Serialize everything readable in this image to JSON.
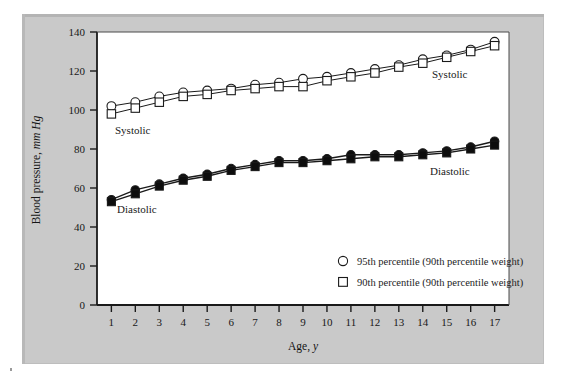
{
  "figure": {
    "panel_background": "#c9c9c9",
    "plot_background": "#ffffff",
    "line_color": "#1a1a1a"
  },
  "axes": {
    "y_title_main": "Blood pressure,",
    "y_title_units": "mm Hg",
    "x_title_main": "Age,",
    "x_title_units": "y",
    "y_ticks": [
      "0",
      "20",
      "40",
      "60",
      "80",
      "100",
      "120",
      "140"
    ],
    "x_ticks": [
      "1",
      "2",
      "3",
      "4",
      "5",
      "6",
      "7",
      "8",
      "9",
      "10",
      "11",
      "12",
      "13",
      "14",
      "15",
      "16",
      "17"
    ]
  },
  "annotations": {
    "systolic_left": "Systolic",
    "systolic_right": "Systolic",
    "diastolic_left": "Diastolic",
    "diastolic_right": "Diastolic"
  },
  "legend": {
    "items": [
      {
        "marker": "circle-open-icon",
        "label": "95th percentile (90th percentile weight)"
      },
      {
        "marker": "square-open-icon",
        "label": "90th percentile (90th percentile weight)"
      }
    ]
  },
  "chart_data": {
    "type": "line",
    "title": "",
    "xlabel": "Age, y",
    "ylabel": "Blood pressure, mm Hg",
    "xlim": [
      0.4,
      17.6
    ],
    "ylim": [
      0,
      140
    ],
    "ytick_step": 20,
    "grid": false,
    "legend_position": "bottom-right",
    "x": [
      1,
      2,
      3,
      4,
      5,
      6,
      7,
      8,
      9,
      10,
      11,
      12,
      13,
      14,
      15,
      16,
      17
    ],
    "series": [
      {
        "name": "Systolic 95th percentile (90th percentile weight)",
        "marker": "circle-open",
        "values": [
          102,
          104,
          107,
          109,
          110,
          111,
          113,
          114,
          116,
          117,
          119,
          121,
          123,
          126,
          128,
          131,
          135
        ]
      },
      {
        "name": "Systolic 90th percentile (90th percentile weight)",
        "marker": "square-open",
        "values": [
          98,
          101,
          104,
          107,
          108,
          110,
          111,
          112,
          112,
          115,
          117,
          119,
          122,
          124,
          127,
          130,
          133
        ]
      },
      {
        "name": "Diastolic 95th percentile (90th percentile weight)",
        "marker": "circle-filled",
        "values": [
          54,
          59,
          62,
          65,
          67,
          70,
          72,
          74,
          74,
          75,
          77,
          77,
          77,
          78,
          79,
          81,
          84
        ]
      },
      {
        "name": "Diastolic 90th percentile (90th percentile weight)",
        "marker": "square-filled",
        "values": [
          53,
          57,
          61,
          64,
          66,
          69,
          71,
          73,
          73,
          74,
          75,
          76,
          76,
          77,
          78,
          80,
          82
        ]
      }
    ]
  }
}
